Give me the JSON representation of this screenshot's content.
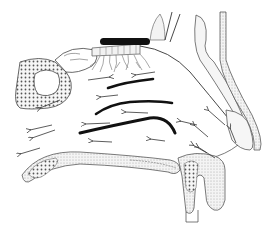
{
  "diagram": {
    "colors": {
      "background": "#ffffff",
      "ink": "#2a2a2a",
      "light_ink": "#6a6a6a",
      "olfactory_bulb": "#111111",
      "turbinate": "#111111",
      "bone_fill": "#f2f2f2"
    },
    "structures": [
      {
        "id": "olfactory-bulb"
      },
      {
        "id": "olfactory-nerve-fibers"
      },
      {
        "id": "sphenoid-sinus"
      },
      {
        "id": "superior-turbinate"
      },
      {
        "id": "middle-turbinate"
      },
      {
        "id": "inferior-turbinate"
      },
      {
        "id": "nasal-bone"
      },
      {
        "id": "nostril"
      },
      {
        "id": "hard-palate"
      },
      {
        "id": "upper-lip-teeth"
      }
    ],
    "airflow_arrows": [
      {
        "x1": 88,
        "y1": 80,
        "x2": 110,
        "y2": 77
      },
      {
        "x1": 155,
        "y1": 72,
        "x2": 135,
        "y2": 75
      },
      {
        "x1": 118,
        "y1": 95,
        "x2": 100,
        "y2": 97
      },
      {
        "x1": 60,
        "y1": 100,
        "x2": 40,
        "y2": 108
      },
      {
        "x1": 148,
        "y1": 113,
        "x2": 125,
        "y2": 112
      },
      {
        "x1": 52,
        "y1": 125,
        "x2": 30,
        "y2": 130
      },
      {
        "x1": 55,
        "y1": 130,
        "x2": 32,
        "y2": 138
      },
      {
        "x1": 110,
        "y1": 123,
        "x2": 85,
        "y2": 124
      },
      {
        "x1": 40,
        "y1": 148,
        "x2": 20,
        "y2": 154
      },
      {
        "x1": 112,
        "y1": 142,
        "x2": 92,
        "y2": 141
      },
      {
        "x1": 165,
        "y1": 141,
        "x2": 150,
        "y2": 139
      },
      {
        "x1": 197,
        "y1": 125,
        "x2": 180,
        "y2": 121
      },
      {
        "x1": 208,
        "y1": 137,
        "x2": 194,
        "y2": 125
      },
      {
        "x1": 215,
        "y1": 158,
        "x2": 198,
        "y2": 147
      },
      {
        "x1": 236,
        "y1": 143,
        "x2": 230,
        "y2": 128
      },
      {
        "x1": 225,
        "y1": 125,
        "x2": 208,
        "y2": 110
      },
      {
        "x1": 207,
        "y1": 153,
        "x2": 193,
        "y2": 145
      }
    ]
  }
}
